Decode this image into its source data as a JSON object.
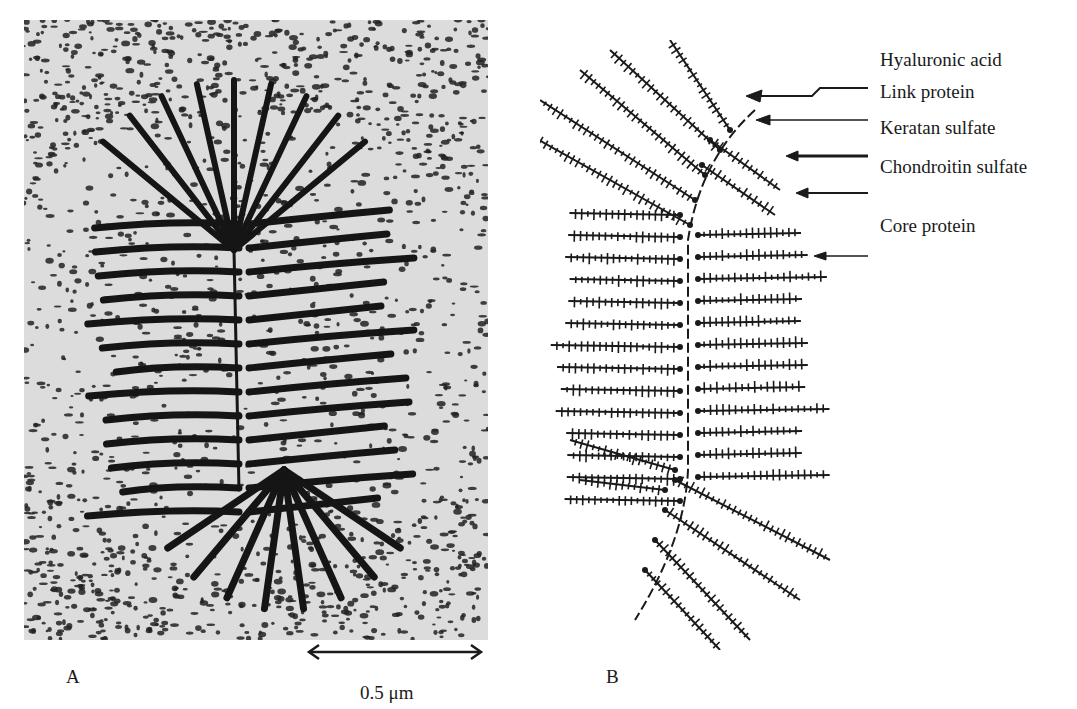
{
  "figure": {
    "panel_a": {
      "label": "A",
      "kind": "electron micrograph",
      "scale_bar": {
        "text": "0.5 μm"
      }
    },
    "panel_b": {
      "label": "B",
      "kind": "schematic of proteoglycan aggregate",
      "callouts": [
        {
          "text": "Hyaluronic acid",
          "y": 60
        },
        {
          "text": "Link protein",
          "y": 92
        },
        {
          "text": "Keratan sulfate",
          "y": 128
        },
        {
          "text": "Chondroitin sulfate",
          "y": 167
        },
        {
          "text": "Core protein",
          "y": 226
        }
      ]
    }
  },
  "colors": {
    "ink": "#1a1a1a",
    "paper": "#ffffff",
    "micrograph_bg": "#e8e8e8"
  }
}
